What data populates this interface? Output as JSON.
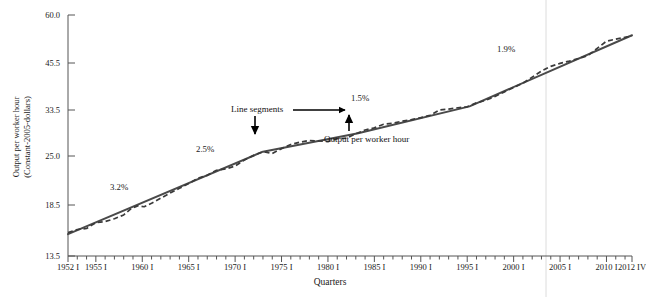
{
  "chart_data": {
    "type": "line",
    "title": "",
    "xlabel": "Quarters",
    "ylabel": "Output per worker hour (Constant-2005-dollars)",
    "ylabel_line1": "Output per worker hour",
    "ylabel_line2": "(Constant-2005-dollars)",
    "ytick_labels": [
      "60.0",
      "45.5",
      "33.5",
      "25.0",
      "18.5",
      "13.5"
    ],
    "ytick_values": [
      60.0,
      45.5,
      33.5,
      25.0,
      18.5,
      13.5
    ],
    "xtick_labels": [
      "1952 I",
      "1955 I",
      "1960 I",
      "1965 I",
      "1970 I",
      "1975 I",
      "1980 I",
      "1985 I",
      "1990 I",
      "1995 I",
      "2000 I",
      "2005 I",
      "2010 I",
      "2012 IV"
    ],
    "xtick_values": [
      1952,
      1955,
      1960,
      1965,
      1970,
      1975,
      1980,
      1985,
      1990,
      1995,
      2000,
      2005,
      2010,
      2012.75
    ],
    "xlim": [
      1952,
      2012.75
    ],
    "ylim": [
      13.5,
      60.0
    ],
    "yscale": "log",
    "grid": false,
    "legend": "none",
    "series": [
      {
        "name": "Output per worker hour",
        "style": "dashed",
        "color": "#3a3a3a",
        "points": [
          [
            1952.0,
            15.6
          ],
          [
            1953.0,
            15.9
          ],
          [
            1954.0,
            16.0
          ],
          [
            1955.0,
            16.6
          ],
          [
            1956.0,
            16.7
          ],
          [
            1957.0,
            17.0
          ],
          [
            1958.0,
            17.4
          ],
          [
            1958.8,
            18.1
          ],
          [
            1959.5,
            18.4
          ],
          [
            1960.2,
            18.3
          ],
          [
            1961.0,
            18.7
          ],
          [
            1962.0,
            19.3
          ],
          [
            1963.0,
            19.9
          ],
          [
            1964.0,
            20.5
          ],
          [
            1965.0,
            21.1
          ],
          [
            1966.0,
            21.8
          ],
          [
            1967.0,
            22.2
          ],
          [
            1968.0,
            22.9
          ],
          [
            1969.0,
            23.1
          ],
          [
            1970.0,
            23.5
          ],
          [
            1971.0,
            24.4
          ],
          [
            1972.0,
            25.1
          ],
          [
            1973.0,
            25.7
          ],
          [
            1974.0,
            25.4
          ],
          [
            1975.0,
            26.2
          ],
          [
            1976.0,
            26.9
          ],
          [
            1977.0,
            27.3
          ],
          [
            1978.0,
            27.6
          ],
          [
            1979.0,
            27.5
          ],
          [
            1980.0,
            27.4
          ],
          [
            1981.0,
            27.9
          ],
          [
            1982.0,
            28.0
          ],
          [
            1983.0,
            28.8
          ],
          [
            1984.0,
            29.5
          ],
          [
            1985.0,
            29.9
          ],
          [
            1986.0,
            30.6
          ],
          [
            1987.0,
            30.8
          ],
          [
            1988.0,
            31.2
          ],
          [
            1989.0,
            31.5
          ],
          [
            1990.0,
            31.9
          ],
          [
            1991.0,
            32.4
          ],
          [
            1992.0,
            33.5
          ],
          [
            1993.0,
            33.7
          ],
          [
            1994.0,
            34.0
          ],
          [
            1995.0,
            34.2
          ],
          [
            1996.0,
            35.1
          ],
          [
            1997.0,
            35.7
          ],
          [
            1998.0,
            36.6
          ],
          [
            1999.0,
            37.7
          ],
          [
            2000.0,
            38.8
          ],
          [
            2001.0,
            39.9
          ],
          [
            2002.0,
            41.5
          ],
          [
            2003.0,
            43.2
          ],
          [
            2004.0,
            44.5
          ],
          [
            2005.0,
            45.4
          ],
          [
            2006.0,
            46.0
          ],
          [
            2007.0,
            46.7
          ],
          [
            2008.0,
            47.5
          ],
          [
            2009.0,
            49.5
          ],
          [
            2010.0,
            51.6
          ],
          [
            2011.0,
            52.2
          ],
          [
            2012.75,
            53.2
          ]
        ]
      },
      {
        "name": "Line segments",
        "style": "solid",
        "color": "#4a4a4a",
        "points": [
          [
            1952.0,
            15.45
          ],
          [
            1973.0,
            25.7
          ],
          [
            1983.25,
            28.9
          ],
          [
            1995.25,
            34.3
          ],
          [
            2012.75,
            53.4
          ]
        ]
      }
    ],
    "annotations": [
      {
        "id": "growth-1",
        "text": "3.2%",
        "x_px": 110,
        "y_px": 182
      },
      {
        "id": "growth-2",
        "text": "2.5%",
        "x_px": 196,
        "y_px": 144
      },
      {
        "id": "growth-3",
        "text": "1.5%",
        "x_px": 351,
        "y_px": 93
      },
      {
        "id": "growth-4",
        "text": "1.9%",
        "x_px": 497,
        "y_px": 44
      },
      {
        "id": "callout-line-segments",
        "text": "Line segments",
        "x_px": 231,
        "y_px": 106
      },
      {
        "id": "callout-output",
        "text": "Output per worker hour",
        "x_px": 324,
        "y_px": 135
      }
    ]
  }
}
